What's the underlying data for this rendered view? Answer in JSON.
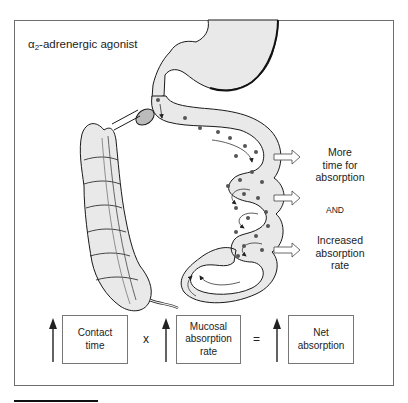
{
  "diagram": {
    "title_prefix": "α",
    "title_sub": "2",
    "title_suffix": "-adrenergic agonist",
    "effects": [
      {
        "lines": [
          "More",
          "time for",
          "absorption"
        ]
      },
      {
        "connector": "AND"
      },
      {
        "lines": [
          "Increased",
          "absorption",
          "rate"
        ]
      }
    ],
    "equation": {
      "terms": [
        {
          "label_lines": [
            "Contact",
            "time"
          ],
          "direction": "up"
        },
        {
          "label_lines": [
            "Mucosal",
            "absorption",
            "rate"
          ],
          "direction": "up"
        },
        {
          "label_lines": [
            "Net",
            "absorption"
          ],
          "direction": "up"
        }
      ],
      "operators": [
        "x",
        "="
      ]
    },
    "illustration": {
      "subject": "gastrointestinal tract (stomach, small intestine loops with particles and flow arrows, colon)",
      "fill_color": "#e9e9e9",
      "outline_color": "#1a1a1a",
      "particle_color": "#555555"
    }
  }
}
